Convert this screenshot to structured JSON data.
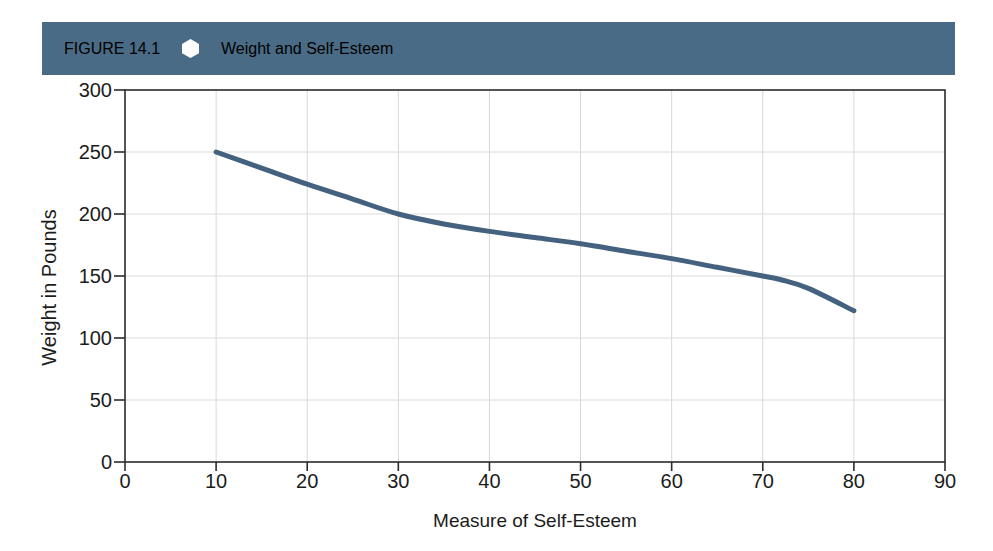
{
  "header": {
    "figure_label": "FIGURE 14.1",
    "title": "Weight and Self-Esteem",
    "bar_color": "#4a6b85",
    "text_color": "#ffffff",
    "separator_icon": "hexagon-icon"
  },
  "chart_data": {
    "type": "line",
    "title": "Weight and Self-Esteem",
    "xlabel": "Measure of Self-Esteem",
    "ylabel": "Weight in Pounds",
    "xlim": [
      0,
      90
    ],
    "ylim": [
      0,
      300
    ],
    "xticks": [
      0,
      10,
      20,
      30,
      40,
      50,
      60,
      70,
      80,
      90
    ],
    "yticks": [
      0,
      50,
      100,
      150,
      200,
      250,
      300
    ],
    "grid": true,
    "legend": null,
    "line_color": "#44627f",
    "line_width": 5,
    "series": [
      {
        "name": "Weight vs Self-Esteem",
        "x": [
          10,
          15,
          20,
          25,
          30,
          35,
          40,
          45,
          50,
          55,
          60,
          65,
          70,
          72,
          75,
          80
        ],
        "y": [
          250,
          237,
          224,
          212,
          200,
          192,
          186,
          181,
          176,
          170,
          164,
          157,
          150,
          147,
          140,
          122
        ]
      }
    ]
  }
}
